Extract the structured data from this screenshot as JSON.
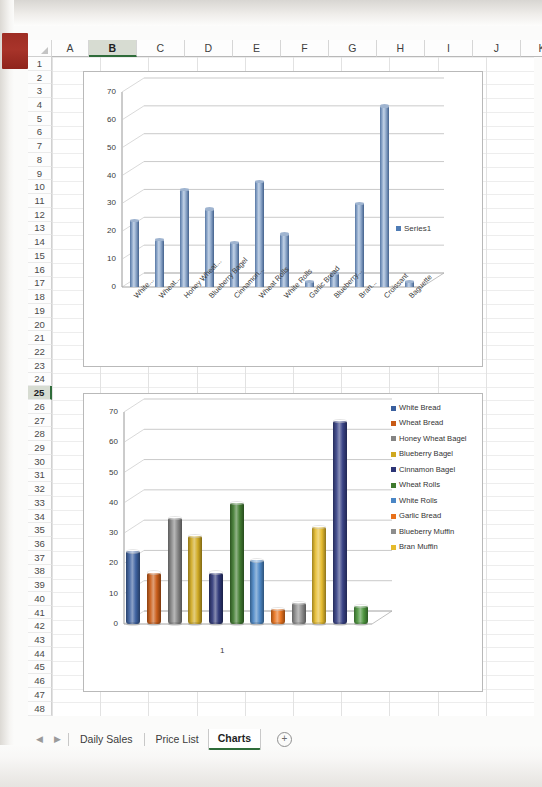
{
  "app": {
    "type": "spreadsheet",
    "active_column": "B",
    "active_row": "25"
  },
  "grid": {
    "columns": [
      "A",
      "B",
      "C",
      "D",
      "E",
      "F",
      "G",
      "H",
      "I",
      "J",
      "K"
    ],
    "rows": [
      "1",
      "2",
      "3",
      "4",
      "5",
      "6",
      "7",
      "8",
      "9",
      "10",
      "11",
      "12",
      "13",
      "14",
      "15",
      "16",
      "17",
      "18",
      "19",
      "20",
      "21",
      "22",
      "23",
      "24",
      "25",
      "26",
      "27",
      "28",
      "29",
      "30",
      "31",
      "32",
      "33",
      "34",
      "35",
      "36",
      "37",
      "38",
      "39",
      "40",
      "41",
      "42",
      "43",
      "44",
      "45",
      "46",
      "47",
      "48"
    ],
    "corner_select_all_icon": "select-all-triangle-icon"
  },
  "sheet_tabs": {
    "prev_icon": "chevron-left-icon",
    "next_icon": "chevron-right-icon",
    "tabs": [
      {
        "label": "Daily Sales",
        "active": false
      },
      {
        "label": "Price List",
        "active": false
      },
      {
        "label": "Charts",
        "active": true
      }
    ],
    "add_sheet_label": "+",
    "add_sheet_icon": "plus-circle-icon"
  },
  "chart_data": [
    {
      "id": "chart1",
      "type": "bar",
      "title": "",
      "xlabel": "",
      "ylabel": "",
      "ylim": [
        0,
        70
      ],
      "yticks": [
        0,
        10,
        20,
        30,
        40,
        50,
        60,
        70
      ],
      "grid": true,
      "legend_position": "right",
      "three_d": true,
      "series_color": "#4f7cb5",
      "categories": [
        "White...",
        "Wheat...",
        "Honey Wheat...",
        "Blueberry Bagel",
        "Cinnamon...",
        "Wheat Rolls",
        "White Rolls",
        "Garlic Bread",
        "Blueberry...",
        "Bran...",
        "Croissant",
        "Baguette"
      ],
      "series": [
        {
          "name": "Series1",
          "values": [
            24,
            17,
            35,
            28,
            16,
            38,
            19,
            2,
            5,
            30,
            65,
            2
          ]
        }
      ]
    },
    {
      "id": "chart2",
      "type": "bar",
      "title": "",
      "xlabel": "",
      "ylabel": "",
      "ylim": [
        0,
        70
      ],
      "yticks": [
        0,
        10,
        20,
        30,
        40,
        50,
        60,
        70
      ],
      "grid": true,
      "legend_position": "right",
      "three_d": true,
      "shape": "cylinder",
      "categories": [
        "1"
      ],
      "series": [
        {
          "name": "White Bread",
          "values": [
            24
          ],
          "color": "#3a5f9e"
        },
        {
          "name": "Wheat Bread",
          "values": [
            17
          ],
          "color": "#c85a15"
        },
        {
          "name": "Honey Wheat Bagel",
          "values": [
            35
          ],
          "color": "#848484"
        },
        {
          "name": "Blueberry Bagel",
          "values": [
            29
          ],
          "color": "#cfa81f"
        },
        {
          "name": "Cinnamon Bagel",
          "values": [
            17
          ],
          "color": "#2c3576"
        },
        {
          "name": "Wheat Rolls",
          "values": [
            40
          ],
          "color": "#3f7a2e"
        },
        {
          "name": "White Rolls",
          "values": [
            21
          ],
          "color": "#4a86c5"
        },
        {
          "name": "Garlic Bread",
          "values": [
            5
          ],
          "color": "#e8701a"
        },
        {
          "name": "Blueberry Muffin",
          "values": [
            7
          ],
          "color": "#8d8d8d"
        },
        {
          "name": "Bran Muffin",
          "values": [
            32
          ],
          "color": "#e5bb2c"
        },
        {
          "name": "Croissant",
          "values": [
            67
          ],
          "color": "#353f84"
        },
        {
          "name": "Baguette",
          "values": [
            6
          ],
          "color": "#49933a"
        }
      ],
      "legend_entries": [
        {
          "label": "White Bread",
          "color": "#3a5f9e"
        },
        {
          "label": "Wheat Bread",
          "color": "#c85a15"
        },
        {
          "label": "Honey Wheat Bagel",
          "color": "#848484"
        },
        {
          "label": "Blueberry Bagel",
          "color": "#cfa81f"
        },
        {
          "label": "Cinnamon Bagel",
          "color": "#2c3576"
        },
        {
          "label": "Wheat Rolls",
          "color": "#3f7a2e"
        },
        {
          "label": "White Rolls",
          "color": "#4a86c5"
        },
        {
          "label": "Garlic Bread",
          "color": "#e8701a"
        },
        {
          "label": "Blueberry Muffin",
          "color": "#8d8d8d"
        },
        {
          "label": "Bran Muffin",
          "color": "#e5bb2c"
        }
      ]
    }
  ]
}
